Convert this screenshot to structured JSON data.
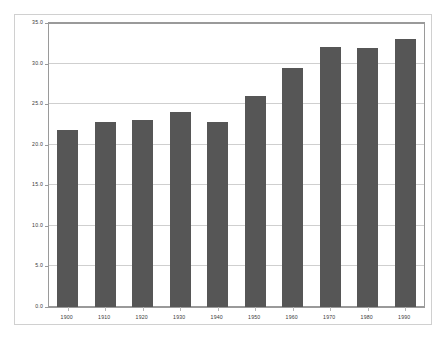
{
  "chart_data": {
    "type": "bar",
    "title": "",
    "subtitle": "",
    "xlabel": "",
    "ylabel": "",
    "categories": [
      "1900",
      "1910",
      "1920",
      "1930",
      "1940",
      "1950",
      "1960",
      "1970",
      "1980",
      "1990"
    ],
    "values": [
      21.8,
      22.8,
      23.0,
      24.0,
      22.8,
      26.0,
      29.4,
      32.0,
      31.9,
      33.0
    ],
    "ylim": [
      0.0,
      35.0
    ],
    "ytick_labels": [
      "0.0",
      "5.0",
      "10.0",
      "15.0",
      "20.0",
      "25.0",
      "30.0",
      "35.0"
    ],
    "ytick_values": [
      0.0,
      5.0,
      10.0,
      15.0,
      20.0,
      25.0,
      30.0,
      35.0
    ],
    "grid": true,
    "legend": false,
    "legend_position": "none",
    "bar_color": "#565656",
    "grid_color": "#cfcfcf",
    "axis_color": "#9a9a9a",
    "frame_color": "#d0d0d0",
    "background_color": "#ffffff"
  }
}
